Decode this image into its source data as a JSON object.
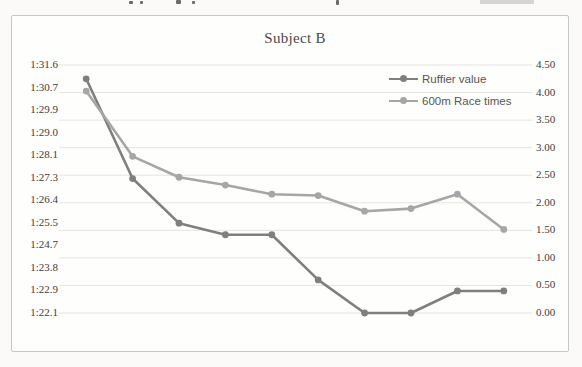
{
  "page": {
    "top_edge_remnant": "bottoms of a cropped text line"
  },
  "colors": {
    "ruffier_series": "#7f7f7f",
    "race_series": "#a6a6a6",
    "gridline": "#e5e4e2",
    "tick_text": "#3d3d3d",
    "title_text": "#4a4a4a",
    "legend_text": "#565656",
    "chart_border": "#c7c7c5"
  },
  "chart_data": {
    "type": "line",
    "title": "Subject B",
    "x": [
      1,
      2,
      3,
      4,
      5,
      6,
      7,
      8,
      9,
      10
    ],
    "xlabel": "",
    "ylabel_left": "",
    "ylabel_right": "",
    "grid": true,
    "legend_position": "inside-top-right",
    "series": [
      {
        "name": "Ruffier value",
        "axis": "right",
        "color": "#7f7f7f",
        "values": [
          4.25,
          2.44,
          1.63,
          1.42,
          1.42,
          0.6,
          0.0,
          0.0,
          0.4,
          0.4
        ]
      },
      {
        "name": "600m Race times",
        "axis": "left",
        "color": "#a6a6a6",
        "values_seconds": [
          90.6,
          88.1,
          87.3,
          87.0,
          86.65,
          86.6,
          86.0,
          86.1,
          86.65,
          85.3
        ],
        "values_display": [
          "1:30.6",
          "1:28.1",
          "1:27.3",
          "1:27.0",
          "1:26.7",
          "1:26.6",
          "1:26.0",
          "1:26.1",
          "1:26.7",
          "1:25.3"
        ]
      }
    ],
    "left_axis": {
      "ticks": [
        "1:31.6",
        "1:30.7",
        "1:29.9",
        "1:29.0",
        "1:28.1",
        "1:27.3",
        "1:26.4",
        "1:25.5",
        "1:24.7",
        "1:23.8",
        "1:22.9",
        "1:22.1"
      ],
      "max_seconds": 91.6,
      "min_seconds": 82.1
    },
    "right_axis": {
      "ticks": [
        "4.50",
        "4.00",
        "3.50",
        "3.00",
        "2.50",
        "2.00",
        "1.50",
        "1.00",
        "0.50",
        "0.00"
      ],
      "max": 4.5,
      "min": 0.0
    }
  }
}
